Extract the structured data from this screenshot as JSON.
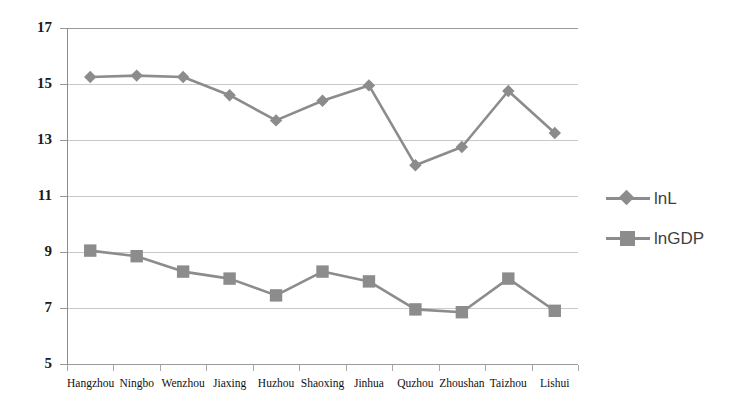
{
  "chart_data": {
    "type": "line",
    "title": "",
    "xlabel": "",
    "ylabel": "",
    "categories": [
      "Hangzhou",
      "Ningbo",
      "Wenzhou",
      "Jiaxing",
      "Huzhou",
      "Shaoxing",
      "Jinhua",
      "Quzhou",
      "Zhoushan",
      "Taizhou",
      "Lishui"
    ],
    "series": [
      {
        "name": "lnL",
        "marker": "diamond",
        "color": "#8c8c8c",
        "values": [
          15.25,
          15.3,
          15.25,
          14.6,
          13.7,
          14.4,
          14.95,
          12.1,
          12.75,
          14.75,
          13.25
        ]
      },
      {
        "name": "lnGDP",
        "marker": "square",
        "color": "#8c8c8c",
        "values": [
          9.05,
          8.85,
          8.3,
          8.05,
          7.45,
          8.3,
          7.95,
          6.95,
          6.85,
          8.05,
          6.9
        ]
      }
    ],
    "ylim": [
      5,
      17
    ],
    "yticks": [
      5,
      7,
      9,
      11,
      13,
      15,
      17
    ],
    "ytick_labels": [
      "5",
      "7",
      "9",
      "11",
      "13",
      "15",
      "17"
    ],
    "grid": true,
    "legend_position": "right"
  },
  "legend": {
    "items": [
      {
        "label": "lnL",
        "marker": "diamond-marker-icon"
      },
      {
        "label": "lnGDP",
        "marker": "square-marker-icon"
      }
    ]
  }
}
